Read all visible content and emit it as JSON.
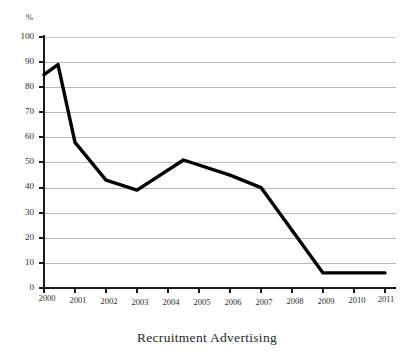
{
  "chart_data": {
    "type": "line",
    "title": "Recruitment Advertising",
    "xlabel": "",
    "ylabel": "%",
    "ylim": [
      0,
      100
    ],
    "yticks": [
      0,
      10,
      20,
      30,
      40,
      50,
      60,
      70,
      80,
      90,
      100
    ],
    "grid": true,
    "legend": "none",
    "categories": [
      "2000",
      "2001",
      "2002",
      "2003",
      "2004",
      "2005",
      "2006",
      "2007",
      "2008",
      "2009",
      "2010",
      "2011"
    ],
    "series": [
      {
        "name": "Recruitment Advertising",
        "color": "#000000",
        "values": [
          85,
          58,
          43,
          39,
          46,
          51,
          45,
          40,
          24,
          6,
          6,
          6
        ]
      }
    ],
    "annotations": [
      {
        "label": "local peak before decline",
        "x": "2000.4",
        "y": 89
      }
    ],
    "vertex_points": [
      {
        "x": "2000",
        "y": 85
      },
      {
        "x": "2000.45",
        "y": 89
      },
      {
        "x": "2001",
        "y": 58
      },
      {
        "x": "2002",
        "y": 43
      },
      {
        "x": "2003",
        "y": 39
      },
      {
        "x": "2004.5",
        "y": 51
      },
      {
        "x": "2006",
        "y": 45
      },
      {
        "x": "2007",
        "y": 40
      },
      {
        "x": "2009",
        "y": 6
      },
      {
        "x": "2011",
        "y": 6
      }
    ]
  },
  "axes": {
    "y_unit": "%",
    "y_tick_labels": [
      "100",
      "90",
      "80",
      "70",
      "60",
      "50",
      "40",
      "30",
      "20",
      "10",
      "0"
    ],
    "x_tick_labels": [
      "2000",
      "2001",
      "2002",
      "2003",
      "2004",
      "2005",
      "2006",
      "2007",
      "2008",
      "2009",
      "2010",
      "2011"
    ]
  },
  "style": {
    "line_color": "#000000",
    "grid_color": "#b9b9b9",
    "axis_color": "#1a1a1a",
    "background": "#ffffff"
  }
}
